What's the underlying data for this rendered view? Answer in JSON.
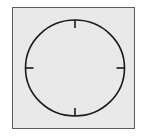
{
  "diagram": {
    "type": "clock-face",
    "tick_positions": [
      "12",
      "3",
      "6",
      "9"
    ],
    "colors": {
      "panel_fill": "#d9d9d9",
      "panel_border": "#5a5a5a",
      "stroke": "#1a1a1a"
    }
  }
}
